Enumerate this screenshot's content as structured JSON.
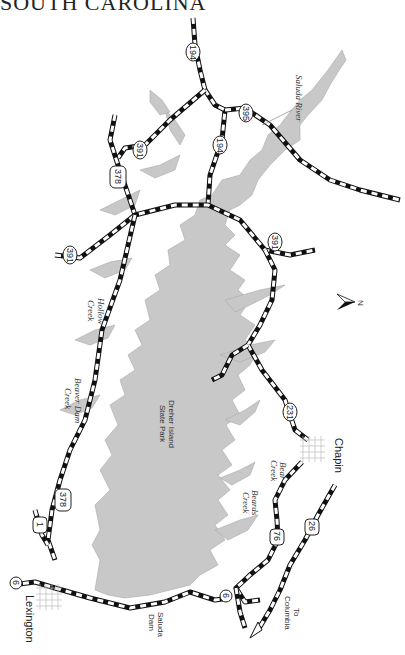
{
  "title": "SOUTH CAROLINA",
  "north_arrow": {
    "label": "N"
  },
  "towns": [
    {
      "name": "Chapin"
    },
    {
      "name": "Lexington"
    }
  ],
  "features": {
    "park": "Dreher Island State Park",
    "park_line1": "Dreher Island",
    "park_line2": "State Park",
    "saluda_river": "Saluda River",
    "hollow_creek_1": "Hollow",
    "hollow_creek_2": "Creek",
    "beaver_dam_1": "Beaver Dam",
    "beaver_dam_2": "Creek",
    "bear_creek_1": "Bear",
    "bear_creek_2": "Creek",
    "beards_creek_1": "Beards",
    "beards_creek_2": "Creek",
    "saluda_dam_1": "Saluda",
    "saluda_dam_2": "Dam",
    "to_columbia_1": "To",
    "to_columbia_2": "Columbia"
  },
  "routes": {
    "r194_top": "194",
    "r194_mid": "194",
    "r395": "395",
    "r391_a": "391",
    "r391_b": "391",
    "r391_c": "391",
    "r378_a": "378",
    "r378_b": "378",
    "r231": "231",
    "r76": "76",
    "r26": "26",
    "r6_a": "6",
    "r6_b": "6",
    "r1": "1"
  },
  "colors": {
    "water": "#c8c8c8",
    "road": "#111111",
    "background": "#ffffff"
  }
}
